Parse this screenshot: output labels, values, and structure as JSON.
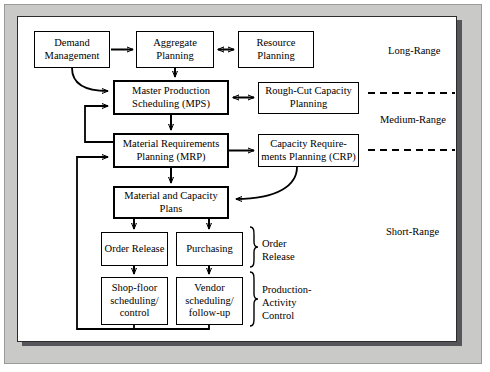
{
  "diagram": {
    "boxes": [
      {
        "id": "demand_management",
        "label": "Demand\nManagement"
      },
      {
        "id": "aggregate_planning",
        "label": "Aggregate\nPlanning"
      },
      {
        "id": "resource_planning",
        "label": "Resource\nPlanning"
      },
      {
        "id": "mps",
        "label": "Master Production\nScheduling (MPS)"
      },
      {
        "id": "rough_cut",
        "label": "Rough-Cut\nCapacity Planning"
      },
      {
        "id": "mrp",
        "label": "Material Requirements\nPlanning (MRP)"
      },
      {
        "id": "crp",
        "label": "Capacity Require-\nments Planning (CRP)"
      },
      {
        "id": "material_capacity",
        "label": "Material and\nCapacity Plans"
      },
      {
        "id": "order_release",
        "label": "Order\nRelease"
      },
      {
        "id": "purchasing",
        "label": "Purchasing"
      },
      {
        "id": "shop_floor",
        "label": "Shop-floor\nscheduling/\ncontrol"
      },
      {
        "id": "vendor",
        "label": "Vendor\nscheduling/\nfollow-up"
      }
    ],
    "range_labels": [
      {
        "id": "long_range",
        "label": "Long-Range"
      },
      {
        "id": "medium_range",
        "label": "Medium-Range"
      },
      {
        "id": "short_range",
        "label": "Short-Range"
      }
    ],
    "bracket_labels": [
      {
        "id": "order_release_group",
        "label": "Order\nRelease"
      },
      {
        "id": "production_activity",
        "label": "Production-\nActivity\nControl"
      }
    ],
    "colors": {
      "line": "#000000",
      "box_fill": "#ffffff",
      "panel_fill": "#ffffff",
      "frame_fill": "#c9c9c7",
      "shadow": "#55555a"
    }
  }
}
